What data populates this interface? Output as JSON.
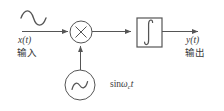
{
  "diagram": {
    "type": "block-diagram",
    "title": "",
    "stroke_color": "#555555",
    "text_color": "#3a3a3a",
    "background": "#ffffff",
    "labels": {
      "input_signal": "x(t)",
      "input_cjk": "输入",
      "output_signal": "y(t)",
      "output_cjk": "输出",
      "carrier_prefix": "sin",
      "carrier_omega": "ω",
      "carrier_subscript": "c",
      "carrier_time": "t"
    },
    "blocks": [
      {
        "name": "multiplier",
        "shape": "circle",
        "glyph": "×",
        "cx": 81,
        "cy": 32,
        "r": 11
      },
      {
        "name": "integrator",
        "shape": "rect",
        "glyph": "∫",
        "x": 137,
        "y": 18,
        "w": 25,
        "h": 29
      },
      {
        "name": "oscillator",
        "shape": "circle",
        "glyph": "∿",
        "cx": 80,
        "cy": 85,
        "r": 15
      }
    ],
    "waveform_glyph": "∿",
    "connections": [
      {
        "name": "input-to-multiplier",
        "from": "input",
        "to": "multiplier",
        "arrow": true
      },
      {
        "name": "multiplier-to-integrator",
        "from": "multiplier",
        "to": "integrator",
        "arrow": true
      },
      {
        "name": "integrator-to-output",
        "from": "integrator",
        "to": "output",
        "arrow": true
      },
      {
        "name": "oscillator-to-multiplier",
        "from": "oscillator",
        "to": "multiplier",
        "arrow": true
      }
    ]
  }
}
